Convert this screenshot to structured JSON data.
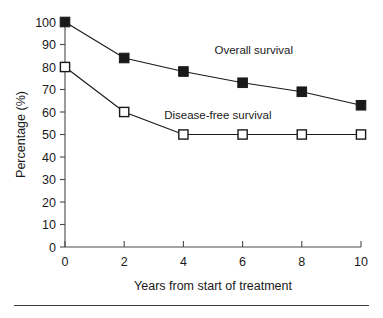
{
  "chart_data": {
    "type": "line",
    "title": "",
    "xlabel": "Years from start of treatment",
    "ylabel": "Percentage (%)",
    "x": [
      0,
      2,
      4,
      6,
      8,
      10
    ],
    "xlim": [
      0,
      10
    ],
    "ylim": [
      0,
      100
    ],
    "xticks": [
      0,
      2,
      4,
      6,
      8,
      10
    ],
    "xtick_labels": [
      "0",
      "2",
      "4",
      "6",
      "8",
      "10"
    ],
    "yticks": [
      0,
      10,
      20,
      30,
      40,
      50,
      60,
      70,
      80,
      90,
      100
    ],
    "ytick_labels": [
      "0",
      "10",
      "20",
      "30",
      "40",
      "50",
      "60",
      "70",
      "80",
      "90",
      "100"
    ],
    "grid": false,
    "legend_position": "inline-annotation",
    "series": [
      {
        "name": "Overall survival",
        "marker": "filled-square",
        "color": "#1a1a1a",
        "values": [
          100,
          84,
          78,
          73,
          69,
          63
        ],
        "annotation": {
          "text": "Overall survival",
          "x": 5.05,
          "y": 86
        }
      },
      {
        "name": "Disease-free survival",
        "marker": "open-square",
        "color": "#1a1a1a",
        "values": [
          80,
          60,
          50,
          50,
          50,
          50
        ],
        "annotation": {
          "text": "Disease-free survival",
          "x": 3.35,
          "y": 57
        }
      }
    ]
  }
}
